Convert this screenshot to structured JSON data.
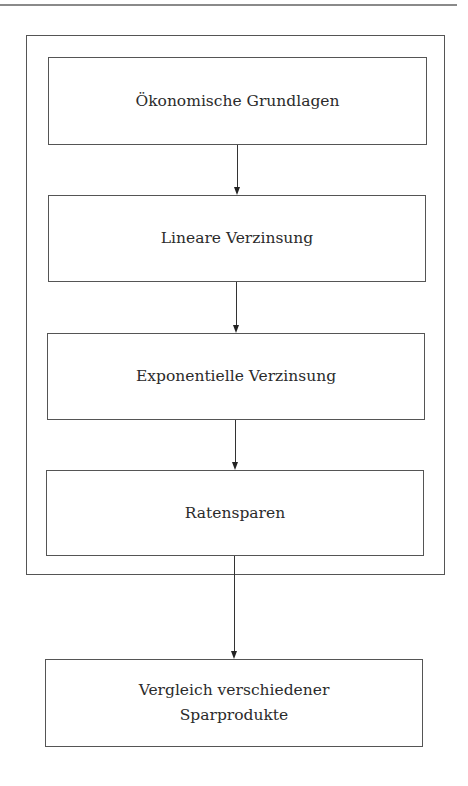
{
  "diagram": {
    "type": "flowchart",
    "direction": "top-to-bottom",
    "group": {
      "label": "",
      "contains": [
        "node_1",
        "node_2",
        "node_3",
        "node_4"
      ]
    },
    "nodes": [
      {
        "id": "node_1",
        "label": "Ökonomische Grundlagen"
      },
      {
        "id": "node_2",
        "label": "Lineare Verzinsung"
      },
      {
        "id": "node_3",
        "label": "Exponentielle Verzinsung"
      },
      {
        "id": "node_4",
        "label": "Ratensparen"
      },
      {
        "id": "node_5",
        "label_line1": "Vergleich verschiedener",
        "label_line2": "Sparprodukte"
      }
    ],
    "edges": [
      {
        "from": "node_1",
        "to": "node_2"
      },
      {
        "from": "node_2",
        "to": "node_3"
      },
      {
        "from": "node_3",
        "to": "node_4"
      },
      {
        "from": "group",
        "to": "node_5"
      }
    ],
    "colors": {
      "line": "#555555",
      "text": "#2b2b2b",
      "background": "#ffffff"
    }
  }
}
